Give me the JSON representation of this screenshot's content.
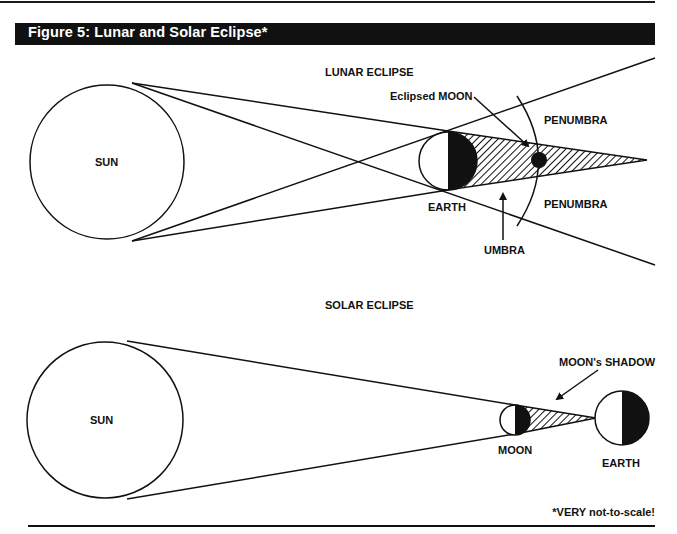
{
  "figure": {
    "title": "Figure 5: Lunar and Solar Eclipse*",
    "footnote": "*VERY not-to-scale!"
  },
  "lunar_eclipse": {
    "heading": "LUNAR ECLIPSE",
    "labels": {
      "sun": "SUN",
      "earth": "EARTH",
      "eclipsed_moon": "Eclipsed MOON",
      "penumbra_top": "PENUMBRA",
      "penumbra_bottom": "PENUMBRA",
      "umbra": "UMBRA"
    }
  },
  "solar_eclipse": {
    "heading": "SOLAR ECLIPSE",
    "labels": {
      "sun": "SUN",
      "moon": "MOON",
      "earth": "EARTH",
      "moons_shadow": "MOON's SHADOW"
    }
  },
  "colors": {
    "ink": "#111111",
    "background": "#ffffff"
  }
}
